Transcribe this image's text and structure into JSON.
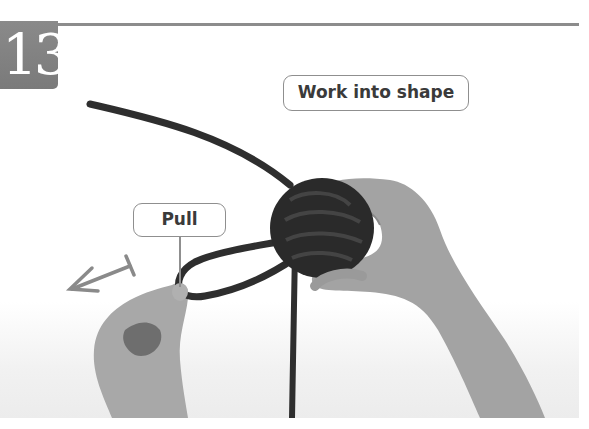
{
  "step": {
    "number": "13"
  },
  "callouts": {
    "work_into_shape": "Work into shape",
    "pull": "Pull"
  },
  "illustration": {
    "subject": "Hands forming a monkey's fist knot from dark rope; left hand pulls a loop, right hand holds the knot",
    "arrow_icon": "double-headed pull arrow pointing left-down",
    "colors": {
      "rope": "#2b2b2b",
      "skin": "#9a9a9a",
      "badge": "#808080",
      "rule": "#8c8c8c",
      "callout_border": "#8f8f8f",
      "callout_text": "#3a3a3a"
    }
  }
}
